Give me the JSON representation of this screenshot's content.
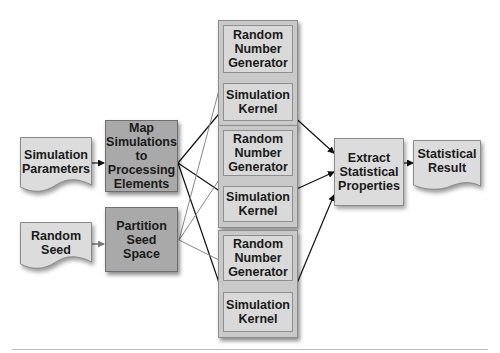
{
  "diagram": {
    "inputs": {
      "simulation_parameters": "Simulation Parameters",
      "random_seed": "Random Seed"
    },
    "steps": {
      "map": "Map Simulations to Processing Elements",
      "partition": "Partition Seed Space",
      "extract": "Extract Statistical Properties"
    },
    "pipelines": [
      {
        "rng": "Random Number Generator",
        "kernel": "Simulation Kernel"
      },
      {
        "rng": "Random Number Generator",
        "kernel": "Simulation Kernel"
      },
      {
        "rng": "Random Number Generator",
        "kernel": "Simulation Kernel"
      }
    ],
    "output": {
      "statistical_result": "Statistical Result"
    },
    "colors": {
      "process_box": "#a9a9a9",
      "light_box": "#dcdcdc",
      "group_box": "#c9c9c9",
      "arrow_dark": "#111111",
      "arrow_gray": "#808080"
    }
  }
}
